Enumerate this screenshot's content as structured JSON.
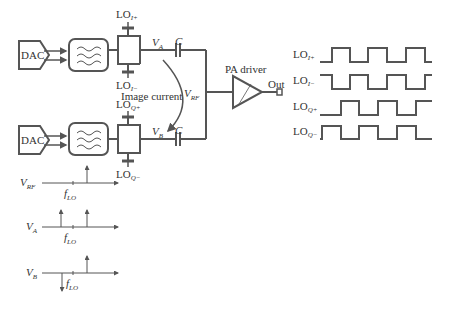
{
  "diagram": {
    "blocks": {
      "dac_top": "DAC",
      "dac_bottom": "DAC",
      "pa_driver": "PA driver",
      "output": "Out"
    },
    "labels": {
      "lo_i_plus": {
        "base": "LO",
        "sub": "I+"
      },
      "lo_i_minus": {
        "base": "LO",
        "sub": "I−"
      },
      "lo_q_plus": {
        "base": "LO",
        "sub": "Q+"
      },
      "lo_q_minus": {
        "base": "LO",
        "sub": "Q−"
      },
      "va": {
        "base": "V",
        "sub": "A"
      },
      "vb": {
        "base": "V",
        "sub": "B"
      },
      "vrf": {
        "base": "V",
        "sub": "RF"
      },
      "cap_top": "C",
      "cap_bottom": "C",
      "image_current": "Image current"
    },
    "waveforms": [
      {
        "label": {
          "base": "LO",
          "sub": "I+"
        }
      },
      {
        "label": {
          "base": "LO",
          "sub": "I−"
        }
      },
      {
        "label": {
          "base": "LO",
          "sub": "Q+"
        }
      },
      {
        "label": {
          "base": "LO",
          "sub": "Q−"
        }
      }
    ],
    "spectra": [
      {
        "label": {
          "base": "V",
          "sub": "RF"
        },
        "tick": {
          "base": "f",
          "sub": "LO"
        }
      },
      {
        "label": {
          "base": "V",
          "sub": "A"
        },
        "tick": {
          "base": "f",
          "sub": "LO"
        }
      },
      {
        "label": {
          "base": "V",
          "sub": "B"
        },
        "tick": {
          "base": "f",
          "sub": "LO"
        }
      }
    ]
  }
}
